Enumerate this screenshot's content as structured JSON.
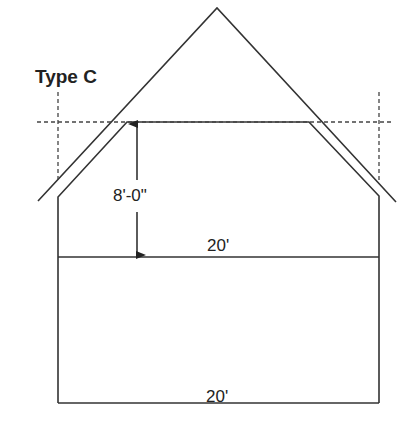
{
  "diagram": {
    "title": "Type C",
    "height_label": "8'-0\"",
    "upper_width_label": "20'",
    "lower_width_label": "20'",
    "line_color": "#333333",
    "background": "#ffffff"
  }
}
